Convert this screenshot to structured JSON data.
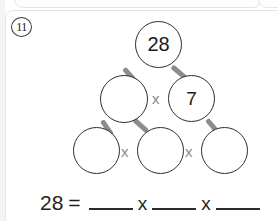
{
  "worksheet": {
    "problem_number": "11",
    "target_number": "28"
  },
  "factor_tree": {
    "rows": [
      {
        "row_name": "top-row",
        "nodes": [
          {
            "id": "node-root",
            "value": "28",
            "filled": true
          }
        ],
        "operators": []
      },
      {
        "row_name": "middle-row",
        "nodes": [
          {
            "id": "node-mid-left",
            "value": "",
            "filled": false
          },
          {
            "id": "node-mid-right",
            "value": "7",
            "filled": true
          }
        ],
        "operators": [
          "x"
        ]
      },
      {
        "row_name": "bottom-row",
        "nodes": [
          {
            "id": "node-bottom-left",
            "value": "",
            "filled": false
          },
          {
            "id": "node-bottom-middle",
            "value": "",
            "filled": false
          },
          {
            "id": "node-bottom-right",
            "value": "",
            "filled": false
          }
        ],
        "operators": [
          "x",
          "x"
        ]
      }
    ]
  },
  "equation": {
    "left_value": "28",
    "equals_sign": "=",
    "operator_1": "x",
    "operator_2": "x",
    "blank_1": "",
    "blank_2": "",
    "blank_3": ""
  },
  "colors": {
    "node_stroke": "#2e2e2e",
    "connector": "#8c8c8c",
    "operator_text": "#8a8a8a",
    "equation_text": "#1f1f1f",
    "page_background": "#ffffff"
  }
}
